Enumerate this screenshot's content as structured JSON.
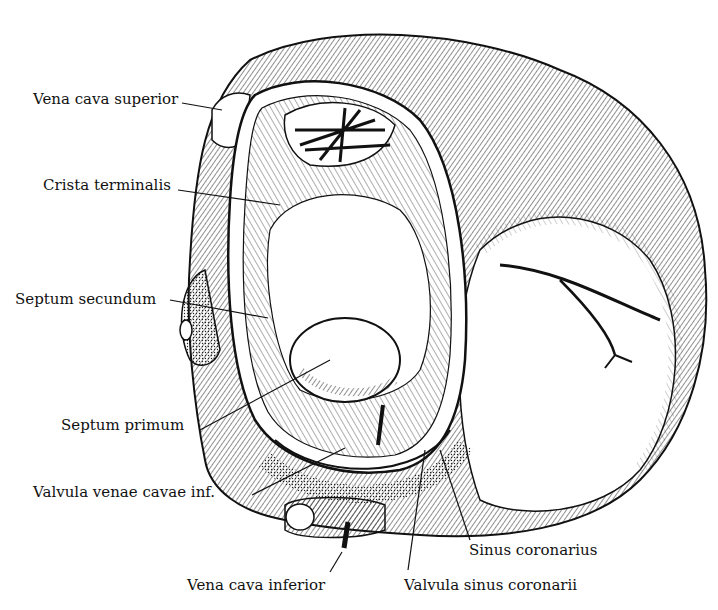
{
  "labels": [
    {
      "id": "vena-cava-superior",
      "text": "Vena cava superior",
      "x": 33,
      "y": 92
    },
    {
      "id": "crista-terminalis",
      "text": "Crista terminalis",
      "x": 43,
      "y": 178
    },
    {
      "id": "septum-secundum",
      "text": "Septum secundum",
      "x": 15,
      "y": 292
    },
    {
      "id": "septum-primum",
      "text": "Septum primum",
      "x": 61,
      "y": 418
    },
    {
      "id": "valvula-venae-cavae-inf",
      "text": "Valvula venae cavae inf.",
      "x": 33,
      "y": 485
    },
    {
      "id": "sinus-coronarius",
      "text": "Sinus coronarius",
      "x": 469,
      "y": 543
    },
    {
      "id": "vena-cava-inferior",
      "text": "Vena cava inferior",
      "x": 187,
      "y": 578
    },
    {
      "id": "valvula-sinus-coronarii",
      "text": "Valvula sinus coronarii",
      "x": 404,
      "y": 578
    }
  ]
}
